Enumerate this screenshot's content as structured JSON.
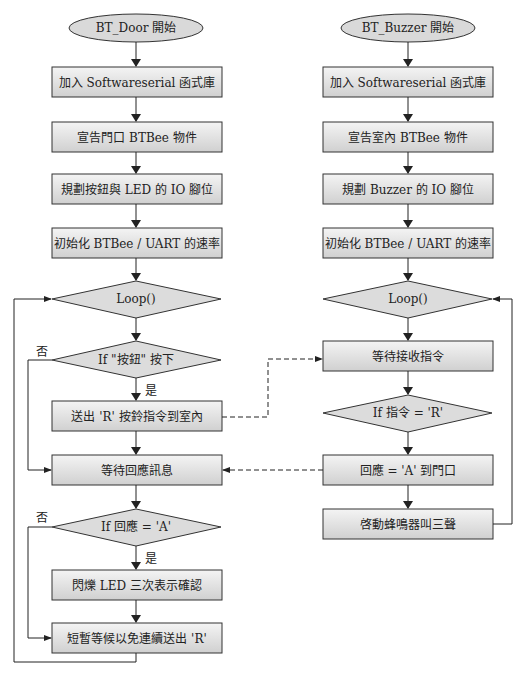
{
  "diagram": {
    "type": "flowchart",
    "left_flow": {
      "title": "BT_Door 開始",
      "steps": [
        "加入 Softwareserial 函式庫",
        "宣告門口 BTBee 物件",
        "規劃按鈕與 LED 的 IO 腳位",
        "初始化 BTBee / UART 的速率"
      ],
      "loop": "Loop()",
      "decision1": "If \"按鈕\" 按下",
      "send": "送出 'R' 按鈴指令到室內",
      "wait": "等待回應訊息",
      "decision2": "If 回應 = 'A'",
      "flash": "閃爍 LED 三次表示確認",
      "delay": "短暫等候以免連續送出 'R'",
      "yes": "是",
      "no": "否"
    },
    "right_flow": {
      "title": "BT_Buzzer 開始",
      "steps": [
        "加入 Softwareserial 函式庫",
        "宣告室內 BTBee 物件",
        "規劃 Buzzer 的 IO 腳位",
        "初始化 BTBee / UART 的速率"
      ],
      "loop": "Loop()",
      "wait_cmd": "等待接收指令",
      "decision": "If 指令 = 'R'",
      "reply": "回應 = 'A' 到門口",
      "buzz": "啓動蜂鳴器叫三聲"
    },
    "colors": {
      "box_fill_top": "#f2f2f2",
      "box_fill_bottom": "#d4d4d4",
      "stroke": "#333333"
    }
  }
}
